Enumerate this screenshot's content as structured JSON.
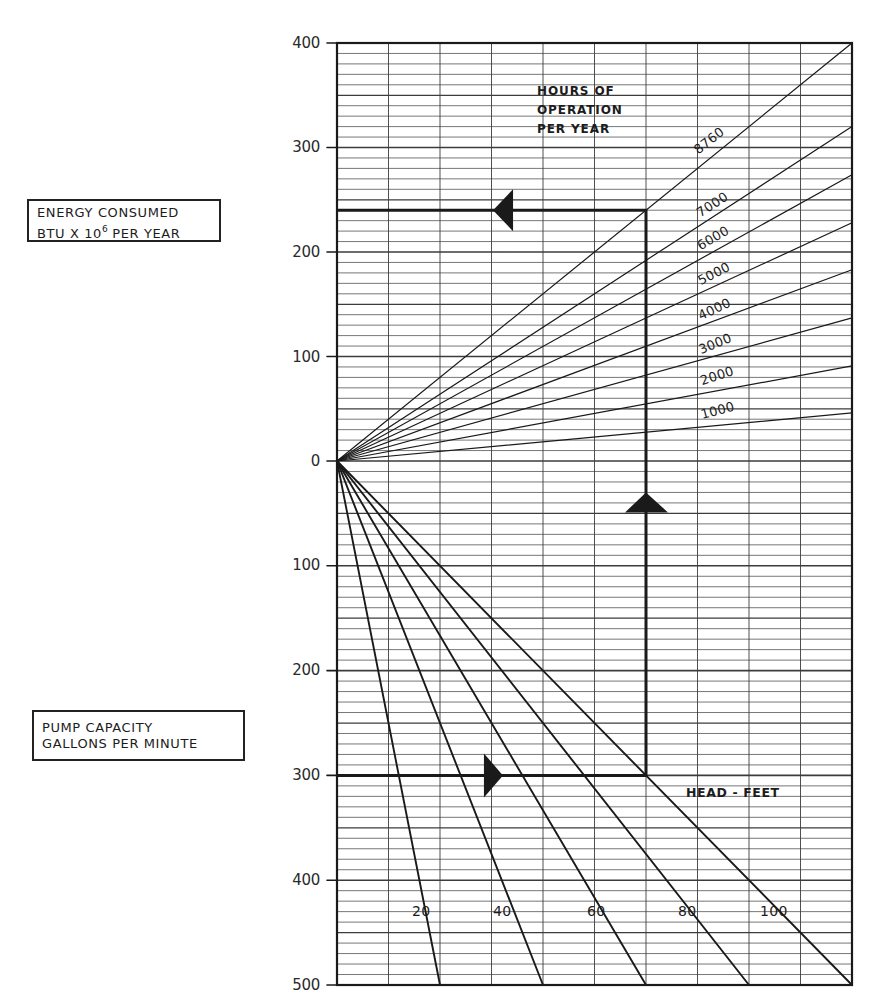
{
  "labels": {
    "energy_axis": {
      "line1": "ENERGY CONSUMED",
      "line2_prefix": "BTU X 10",
      "line2_exponent": "6",
      "line2_suffix": " PER YEAR"
    },
    "pump_axis": {
      "line1": "PUMP CAPACITY",
      "line2": "GALLONS PER MINUTE"
    },
    "hours_title": {
      "line1": "HOURS OF",
      "line2": "OPERATION",
      "line3": "PER YEAR"
    },
    "head_axis": "HEAD - FEET"
  },
  "chart_data": {
    "type": "line",
    "subtype": "nomograph",
    "title": "",
    "grid": true,
    "x_divisions": 10,
    "minor_step": 10,
    "colors": {
      "ink": "#1a1a1a",
      "grid": "#3c3c3c",
      "paper": "#ffffff"
    },
    "upper": {
      "ylabel": "ENERGY CONSUMED BTU X 10^6 PER YEAR",
      "ylim": [
        0,
        400
      ],
      "ticks": [
        400,
        300,
        200,
        100,
        0
      ],
      "tick_labels": [
        "400",
        "300",
        "200",
        "100",
        "0"
      ],
      "legend_title": "HOURS OF OPERATION PER YEAR",
      "lines": [
        {
          "label": "8760",
          "end_x": 10,
          "end_y": 400
        },
        {
          "label": "7000",
          "end_x": 10,
          "end_y": 320
        },
        {
          "label": "6000",
          "end_x": 10,
          "end_y": 274
        },
        {
          "label": "5000",
          "end_x": 10,
          "end_y": 228
        },
        {
          "label": "4000",
          "end_x": 10,
          "end_y": 183
        },
        {
          "label": "3000",
          "end_x": 10,
          "end_y": 137
        },
        {
          "label": "2000",
          "end_x": 10,
          "end_y": 91
        },
        {
          "label": "1000",
          "end_x": 10,
          "end_y": 46
        }
      ]
    },
    "lower": {
      "ylabel": "PUMP CAPACITY GALLONS PER MINUTE",
      "xlabel": "HEAD - FEET",
      "ylim": [
        0,
        500
      ],
      "ticks": [
        100,
        200,
        300,
        400,
        500
      ],
      "tick_labels": [
        "100",
        "200",
        "300",
        "400",
        "500"
      ],
      "lines": [
        {
          "label": "20",
          "end_x": 2,
          "end_y": 500
        },
        {
          "label": "40",
          "end_x": 4,
          "end_y": 500
        },
        {
          "label": "60",
          "end_x": 6,
          "end_y": 500
        },
        {
          "label": "80",
          "end_x": 8,
          "end_y": 500
        },
        {
          "label": "100",
          "end_x": 10,
          "end_y": 500
        }
      ]
    },
    "example_path": {
      "pump_capacity_gpm": 300,
      "head_feet": 100,
      "hours_per_year": 8760,
      "energy": 240,
      "x_units": 6
    }
  }
}
